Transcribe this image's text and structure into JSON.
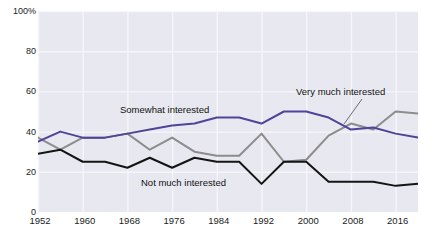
{
  "chart_data": {
    "type": "line",
    "title": "",
    "subtitle": "",
    "xlabel": "",
    "ylabel": "",
    "xlim": [
      1952,
      2020
    ],
    "ylim": [
      0,
      100
    ],
    "grid": true,
    "legend_position": "inline-annotations",
    "x": [
      1952,
      1956,
      1960,
      1964,
      1968,
      1972,
      1976,
      1980,
      1984,
      1988,
      1992,
      1996,
      2000,
      2004,
      2008,
      2012,
      2016,
      2020
    ],
    "xticks": [
      "1952",
      "1960",
      "1968",
      "1976",
      "1984",
      "1992",
      "2000",
      "2008",
      "2016"
    ],
    "xtick_values": [
      1952,
      1960,
      1968,
      1976,
      1984,
      1992,
      2000,
      2008,
      2016
    ],
    "yticks": [
      "0",
      "20",
      "40",
      "60",
      "80",
      "100%"
    ],
    "ytick_values": [
      0,
      20,
      40,
      60,
      80,
      100
    ],
    "series": [
      {
        "name": "Somewhat interested",
        "color": "#4f4498",
        "values": [
          35,
          40,
          37,
          37,
          39,
          41,
          43,
          44,
          47,
          47,
          44,
          50,
          50,
          47,
          41,
          42,
          39,
          37
        ]
      },
      {
        "name": "Very much interested",
        "color": "#8c8c8c",
        "values": [
          37,
          31,
          37,
          37,
          39,
          31,
          37,
          30,
          28,
          28,
          39,
          25,
          26,
          38,
          44,
          41,
          50,
          49
        ]
      },
      {
        "name": "Not much interested",
        "color": "#141414",
        "values": [
          29,
          31,
          25,
          25,
          22,
          27,
          22,
          27,
          25,
          25,
          14,
          25,
          25,
          15,
          15,
          15,
          13,
          14
        ]
      }
    ],
    "annotations": [
      {
        "text": "Somewhat interested",
        "series": "Somewhat interested",
        "x_px": 120,
        "y_px": 104,
        "leader": false
      },
      {
        "text": "Very much interested",
        "series": "Very much interested",
        "x_px": 296,
        "y_px": 86,
        "leader": true
      },
      {
        "text": "Not much interested",
        "series": "Not much interested",
        "x_px": 141,
        "y_px": 177,
        "leader": false
      }
    ],
    "colors": {
      "plot_background": "#e6e7ef",
      "gridline": "#f6f6fa",
      "page_background": "#ffffff",
      "axis_text": "#1b1b1b"
    }
  }
}
